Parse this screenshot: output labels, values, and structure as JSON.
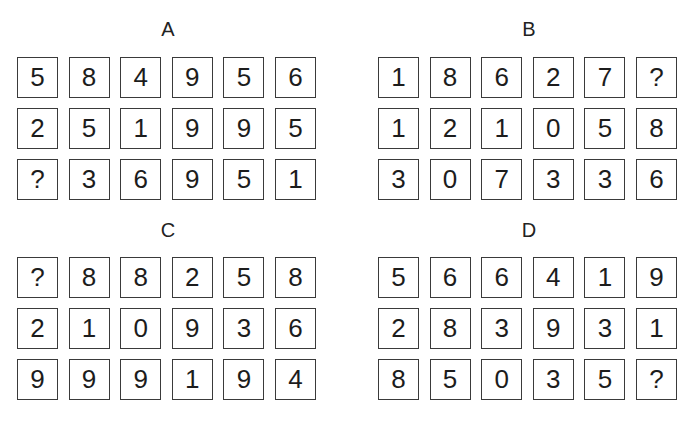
{
  "panels": [
    {
      "label": "A",
      "rows": [
        [
          "5",
          "8",
          "4",
          "9",
          "5",
          "6"
        ],
        [
          "2",
          "5",
          "1",
          "9",
          "9",
          "5"
        ],
        [
          "?",
          "3",
          "6",
          "9",
          "5",
          "1"
        ]
      ]
    },
    {
      "label": "B",
      "rows": [
        [
          "1",
          "8",
          "6",
          "2",
          "7",
          "?"
        ],
        [
          "1",
          "2",
          "1",
          "0",
          "5",
          "8"
        ],
        [
          "3",
          "0",
          "7",
          "3",
          "3",
          "6"
        ]
      ]
    },
    {
      "label": "C",
      "rows": [
        [
          "?",
          "8",
          "8",
          "2",
          "5",
          "8"
        ],
        [
          "2",
          "1",
          "0",
          "9",
          "3",
          "6"
        ],
        [
          "9",
          "9",
          "9",
          "1",
          "9",
          "4"
        ]
      ]
    },
    {
      "label": "D",
      "rows": [
        [
          "5",
          "6",
          "6",
          "4",
          "1",
          "9"
        ],
        [
          "2",
          "8",
          "3",
          "9",
          "3",
          "1"
        ],
        [
          "8",
          "5",
          "0",
          "3",
          "5",
          "?"
        ]
      ]
    }
  ]
}
